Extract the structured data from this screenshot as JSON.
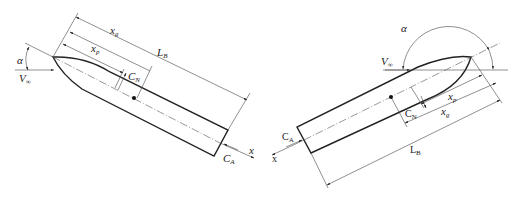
{
  "figure": {
    "left": {
      "labels": {
        "alpha": "α",
        "v_inf": "V",
        "v_inf_sub": "∞",
        "x_g": "x",
        "x_g_sub": "g",
        "x_p": "x",
        "x_p_sub": "p",
        "L_B": "L",
        "L_B_sub": "B",
        "C_N": "C",
        "C_N_sub": "N",
        "C_A": "C",
        "C_A_sub": "A",
        "x_axis": "x"
      }
    },
    "right": {
      "labels": {
        "alpha": "α",
        "v_inf": "V",
        "v_inf_sub": "∞",
        "x_p": "x",
        "x_p_sub": "p",
        "x_g": "x",
        "x_g_sub": "g",
        "L_B": "L",
        "L_B_sub": "B",
        "C_N": "C",
        "C_N_sub": "N",
        "C_A": "C",
        "C_A_sub": "A",
        "x_axis": "x"
      }
    }
  }
}
